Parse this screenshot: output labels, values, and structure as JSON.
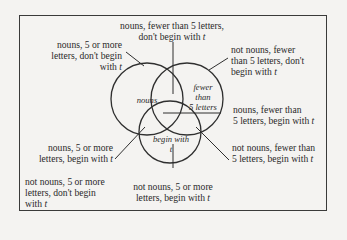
{
  "diagram": {
    "type": "venn",
    "sets": [
      {
        "id": "nouns",
        "label": "nouns"
      },
      {
        "id": "fewer",
        "label_lines": [
          "fewer",
          "than",
          "5 letters"
        ]
      },
      {
        "id": "t",
        "label_lines": [
          "begin with",
          "t"
        ]
      }
    ],
    "regions": {
      "top": {
        "lines": [
          "nouns, fewer than 5 letters,",
          "don't begin with "
        ],
        "italic_tail": "t"
      },
      "upper_left": {
        "lines": [
          "nouns, 5 or more",
          "letters, don't begin",
          "with "
        ],
        "italic_tail": "t"
      },
      "upper_right": {
        "lines": [
          "not nouns, fewer",
          "than 5 letters, don't",
          "begin with "
        ],
        "italic_tail": "t"
      },
      "mid_right": {
        "lines": [
          "nouns, fewer than",
          "5 letters, begin with "
        ],
        "italic_tail": "t"
      },
      "lower_left": {
        "lines": [
          "nouns, 5 or more",
          "letters, begin with "
        ],
        "italic_tail": "t"
      },
      "lower_right": {
        "lines": [
          "not nouns, fewer than",
          "5 letters, begin with "
        ],
        "italic_tail": "t"
      },
      "bottom_left": {
        "lines": [
          "not nouns, 5 or more",
          "letters, don't begin",
          "with "
        ],
        "italic_tail": "t"
      },
      "bottom_center": {
        "lines": [
          "not nouns, 5 or more",
          "letters, begin with "
        ],
        "italic_tail": "t"
      }
    }
  }
}
